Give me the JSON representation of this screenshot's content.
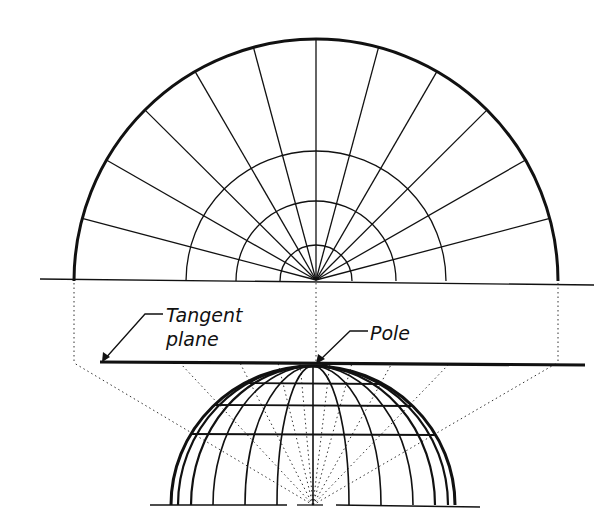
{
  "figure": {
    "labels": {
      "tangent_plane_line1": "Tangent",
      "tangent_plane_line2": "plane",
      "pole": "Pole"
    },
    "colors": {
      "ink": "#111111",
      "background": "#ffffff"
    }
  },
  "upper_projection": {
    "center": [
      316,
      281
    ],
    "outer_radius": 242,
    "parallel_radii": [
      130,
      80,
      36
    ],
    "meridian_angles_deg": [
      15,
      30,
      45,
      60,
      75,
      90,
      105,
      120,
      135,
      150,
      165
    ]
  },
  "lower_globe": {
    "pole": [
      313,
      366
    ],
    "base_y": 505,
    "meridian_offsets": [
      142,
      135,
      122,
      100,
      68,
      36,
      0
    ],
    "parallels_y": [
      383,
      405,
      434
    ]
  },
  "tangent_plane": {
    "y": 362,
    "x_start": 100,
    "x_end": 585
  }
}
